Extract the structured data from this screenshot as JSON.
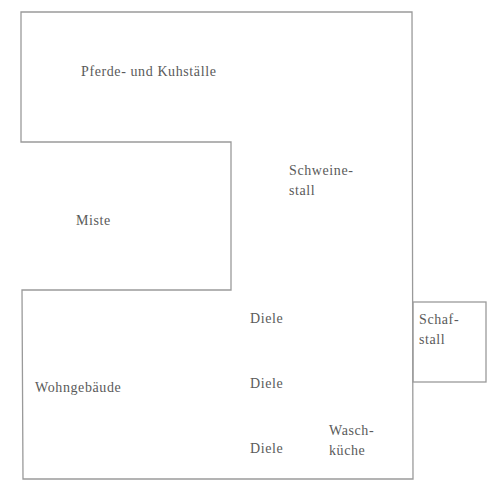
{
  "diagram": {
    "type": "floor-plan",
    "line_color": "#9a9a9a",
    "rooms": [
      {
        "id": "pferde-kuhstaelle",
        "label": "Pferde- und Kuhställe"
      },
      {
        "id": "schweinestall",
        "label_line1": "Schweine-",
        "label_line2": "stall"
      },
      {
        "id": "miste",
        "label": "Miste"
      },
      {
        "id": "wohngebaeude",
        "label": "Wohngebäude"
      },
      {
        "id": "diele-1",
        "label": "Diele"
      },
      {
        "id": "diele-2",
        "label": "Diele"
      },
      {
        "id": "diele-3",
        "label": "Diele"
      },
      {
        "id": "waschkueche",
        "label_line1": "Wasch-",
        "label_line2": "küche"
      },
      {
        "id": "schafstall",
        "label_line1": "Schaf-",
        "label_line2": "stall"
      }
    ]
  }
}
